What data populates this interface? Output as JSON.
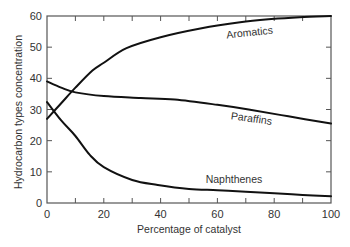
{
  "chart_data": {
    "type": "line",
    "title": "",
    "xlabel": "Percentage of catalyst",
    "ylabel": "Hydrocarbon types concentration",
    "xlim": [
      0,
      100
    ],
    "ylim": [
      0,
      60
    ],
    "xticks": [
      0,
      20,
      40,
      60,
      80,
      100
    ],
    "yticks": [
      0,
      10,
      20,
      30,
      40,
      50,
      60
    ],
    "minor_xticks": [
      10,
      30,
      50,
      70,
      90
    ],
    "grid": false,
    "legend": "none (inline curve labels)",
    "series": [
      {
        "name": "Aromatics",
        "x": [
          0,
          5,
          10,
          16,
          20,
          28,
          40,
          54,
          68,
          79,
          89,
          100
        ],
        "y": [
          27,
          32,
          37,
          42.5,
          45,
          49.7,
          53.2,
          56,
          58,
          59,
          59.6,
          60
        ],
        "label_pos": {
          "x": 250,
          "y": 36,
          "rotate": -6
        }
      },
      {
        "name": "Paraffins",
        "x": [
          0,
          5,
          10,
          20,
          33,
          45,
          60,
          71,
          85,
          100
        ],
        "y": [
          39,
          37,
          35.5,
          34.3,
          33.7,
          33.2,
          31.5,
          30,
          27.8,
          25.5
        ],
        "label_pos": {
          "x": 251,
          "y": 122,
          "rotate": 8
        }
      },
      {
        "name": "Naphthenes",
        "x": [
          0,
          5,
          10,
          15,
          20,
          30,
          39,
          50,
          60,
          70,
          80,
          90,
          100
        ],
        "y": [
          32.4,
          26.5,
          21.5,
          15.5,
          11.5,
          7.4,
          5.8,
          4.5,
          4.1,
          3.6,
          3.1,
          2.6,
          2.2
        ],
        "label_pos": {
          "x": 234,
          "y": 183,
          "rotate": 0
        }
      }
    ]
  },
  "chart_style": {
    "line_color": "#111111",
    "axis_color": "#555555",
    "text_color": "#333333",
    "plot_area": {
      "left": 47,
      "right": 331,
      "top": 16,
      "bottom": 203
    }
  }
}
